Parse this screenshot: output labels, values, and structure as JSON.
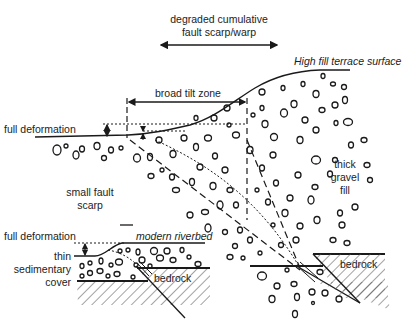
{
  "diagram": {
    "labels": {
      "degraded_line1": "degraded cumulative",
      "degraded_line2": "fault scarp/warp",
      "high_fill_surface": "High fill terrace surface",
      "broad_tilt_zone": "broad tilt zone",
      "full_deformation_top": "full deformation",
      "small_fault_line1": "small fault",
      "small_fault_line2": "scarp",
      "thick_line1": "thick",
      "thick_line2": "gravel",
      "thick_line3": "fill",
      "full_deformation_bottom": "full deformation",
      "modern_riverbed": "modern riverbed",
      "thin_line1": "thin",
      "thin_line2": "sedimentary",
      "thin_line3": "cover",
      "bedrock_bottom": "bedrock",
      "bedrock_right": "bedrock"
    },
    "colors": {
      "line": "#1a1a1a",
      "text": "#222222",
      "hatch": "#555555",
      "background": "#ffffff"
    }
  }
}
